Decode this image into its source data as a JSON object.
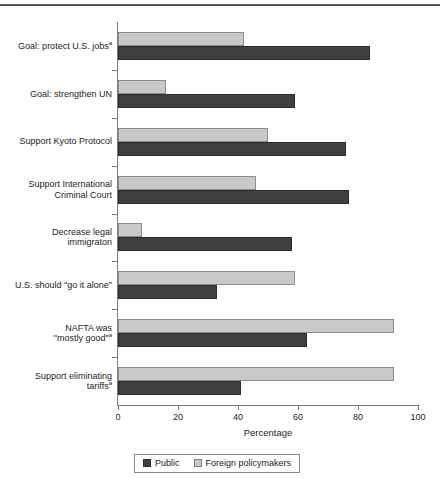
{
  "chart_data": {
    "type": "bar",
    "orientation": "horizontal",
    "title": "",
    "xlabel": "Percentage",
    "ylabel": "",
    "xlim": [
      0,
      100
    ],
    "xticks": [
      0,
      20,
      40,
      60,
      80,
      100
    ],
    "grid": false,
    "legend_position": "bottom",
    "categories": [
      "Goal: protect U.S. jobs",
      "Goal: strengthen UN",
      "Support Kyoto Protocol",
      "Support International Criminal Court",
      "Decrease legal immigraton",
      "U.S. should \"go it alone\"",
      "NAFTA was \"mostly good\"",
      "Support eliminating tariffs"
    ],
    "category_footnotes": [
      "a",
      "",
      "",
      "",
      "",
      "",
      "a",
      "a"
    ],
    "category_lines": [
      [
        "Goal: protect U.S. jobs"
      ],
      [
        "Goal: strengthen UN"
      ],
      [
        "Support Kyoto Protocol"
      ],
      [
        "Support International",
        "Criminal Court"
      ],
      [
        "Decrease legal",
        "immigraton"
      ],
      [
        "U.S. should \"go it alone\""
      ],
      [
        "NAFTA was",
        "\"mostly good\""
      ],
      [
        "Support eliminating",
        "tariffs"
      ]
    ],
    "series": [
      {
        "name": "Public",
        "color": "#3f3f3f",
        "values": [
          84,
          59,
          76,
          77,
          58,
          33,
          63,
          41
        ]
      },
      {
        "name": "Foreign policymakers",
        "color": "#c9c9c9",
        "values": [
          42,
          16,
          50,
          46,
          8,
          59,
          92,
          92
        ]
      }
    ]
  },
  "axis": {
    "x_title": "Percentage",
    "x_tick_labels": [
      "0",
      "20",
      "40",
      "60",
      "80",
      "100"
    ]
  },
  "legend": {
    "entries": [
      {
        "label": "Public",
        "swatch": "dark-swatch"
      },
      {
        "label": "Foreign policymakers",
        "swatch": "light-swatch"
      }
    ]
  }
}
